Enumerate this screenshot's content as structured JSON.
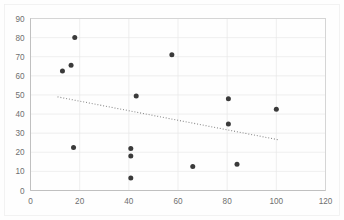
{
  "chart_data": {
    "type": "scatter",
    "title": "",
    "xlabel": "",
    "ylabel": "",
    "xlim": [
      0,
      120
    ],
    "ylim": [
      0,
      90
    ],
    "xticks": [
      0,
      20,
      40,
      60,
      80,
      100,
      120
    ],
    "yticks": [
      0,
      10,
      20,
      30,
      40,
      50,
      60,
      70,
      80,
      90
    ],
    "xtick_labels": [
      "0",
      "20",
      "40",
      "60",
      "80",
      "100",
      "120"
    ],
    "ytick_labels": [
      "0",
      "10",
      "20",
      "30",
      "40",
      "50",
      "60",
      "70",
      "80",
      "90"
    ],
    "grid": true,
    "legend": false,
    "legend_position": "none",
    "marker_color": "#3a3a3a",
    "marker_size": 5,
    "series": [
      {
        "name": "Series 1",
        "points": [
          {
            "x": 13,
            "y": 62.5
          },
          {
            "x": 16.5,
            "y": 65.5
          },
          {
            "x": 18,
            "y": 80
          },
          {
            "x": 17.5,
            "y": 22.5
          },
          {
            "x": 40.8,
            "y": 22
          },
          {
            "x": 40.8,
            "y": 18
          },
          {
            "x": 40.8,
            "y": 6.5
          },
          {
            "x": 43,
            "y": 49.5
          },
          {
            "x": 57.5,
            "y": 71
          },
          {
            "x": 66,
            "y": 12.5
          },
          {
            "x": 80.5,
            "y": 48
          },
          {
            "x": 80.5,
            "y": 34.8
          },
          {
            "x": 84,
            "y": 13.7
          },
          {
            "x": 100,
            "y": 42.5
          }
        ]
      }
    ],
    "trendline": {
      "name": "Linear trendline",
      "style": "dotted",
      "color": "#8c8c8c",
      "x_start": 11,
      "y_start": 49,
      "x_end": 101,
      "y_end": 26.5
    }
  }
}
